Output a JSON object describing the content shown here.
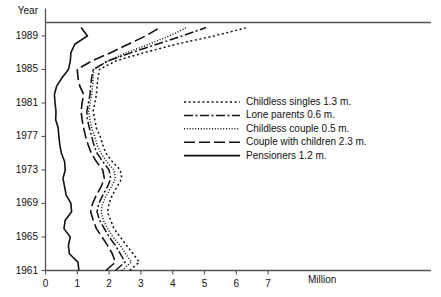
{
  "chart_data": {
    "type": "line",
    "title": "",
    "xlabel": "Million",
    "ylabel": "Year",
    "orientation": "horizontal-value-vertical-time",
    "xlim": [
      0,
      7.6
    ],
    "ylim": [
      1961,
      1990.6
    ],
    "grid": false,
    "xticks": [
      0,
      1,
      2,
      3,
      4,
      5,
      6,
      7
    ],
    "xticklabels": [
      "0",
      "1",
      "2",
      "3",
      "4",
      "5",
      "6",
      "7"
    ],
    "yticks": [
      1961,
      1965,
      1969,
      1973,
      1977,
      1981,
      1985,
      1989
    ],
    "yticklabels": [
      "1961",
      "1965",
      "1969",
      "1973",
      "1977",
      "1981",
      "1985",
      "1989"
    ],
    "legend_position": "center-right",
    "x": [
      1961,
      1962,
      1963,
      1964,
      1965,
      1966,
      1967,
      1968,
      1969,
      1970,
      1971,
      1972,
      1973,
      1974,
      1975,
      1976,
      1977,
      1978,
      1979,
      1980,
      1981,
      1982,
      1983,
      1984,
      1985,
      1986,
      1987,
      1988,
      1989,
      1990
    ],
    "series": [
      {
        "name": "Childless singles 1.3 m.",
        "label": "Childless singles",
        "value": 1.3,
        "dash": "2,2.6",
        "width": 1.5,
        "values": [
          2.65,
          2.95,
          2.75,
          2.55,
          2.35,
          2.15,
          2.05,
          1.95,
          2.0,
          2.1,
          2.25,
          2.4,
          2.35,
          2.1,
          1.9,
          1.8,
          1.72,
          1.6,
          1.55,
          1.5,
          1.55,
          1.6,
          1.62,
          1.65,
          1.7,
          2.2,
          3.1,
          4.1,
          5.3,
          6.35
        ]
      },
      {
        "name": "Lone parents 0.6 m.",
        "label": "Lone parents",
        "value": 0.6,
        "dash": "9,2.5,2,2.5",
        "width": 1.5,
        "values": [
          2.2,
          2.5,
          2.35,
          2.2,
          2.0,
          1.85,
          1.7,
          1.62,
          1.68,
          1.8,
          1.95,
          2.05,
          2.0,
          1.8,
          1.62,
          1.52,
          1.45,
          1.38,
          1.32,
          1.3,
          1.35,
          1.4,
          1.42,
          1.45,
          1.5,
          1.95,
          2.7,
          3.5,
          4.3,
          5.05
        ]
      },
      {
        "name": "Childless couple 0.5 m.",
        "label": "Childless couple",
        "value": 0.5,
        "dash": "1,1.8",
        "width": 1.5,
        "values": [
          2.4,
          2.7,
          2.52,
          2.35,
          2.12,
          1.95,
          1.82,
          1.75,
          1.8,
          1.92,
          2.08,
          2.2,
          2.15,
          1.92,
          1.74,
          1.62,
          1.55,
          1.45,
          1.4,
          1.36,
          1.4,
          1.45,
          1.48,
          1.5,
          1.52,
          1.95,
          2.55,
          3.25,
          3.9,
          4.45
        ]
      },
      {
        "name": "Couple with children 2.3 m.",
        "label": "Couple with children",
        "value": 2.3,
        "dash": "11,4",
        "width": 1.6,
        "values": [
          1.9,
          2.2,
          2.1,
          1.95,
          1.78,
          1.6,
          1.5,
          1.42,
          1.48,
          1.6,
          1.75,
          1.85,
          1.8,
          1.6,
          1.44,
          1.34,
          1.26,
          1.2,
          1.15,
          1.12,
          1.15,
          1.2,
          1.08,
          1.02,
          1.0,
          1.45,
          2.05,
          2.6,
          3.15,
          3.6
        ]
      },
      {
        "name": "Pensioners 1.2 m.",
        "label": "Pensioners",
        "value": 1.2,
        "dash": "",
        "width": 1.6,
        "values": [
          1.05,
          1.02,
          0.75,
          0.72,
          0.78,
          0.58,
          0.62,
          0.82,
          0.8,
          0.65,
          0.6,
          0.55,
          0.62,
          0.6,
          0.5,
          0.45,
          0.42,
          0.4,
          0.32,
          0.33,
          0.3,
          0.28,
          0.35,
          0.52,
          0.72,
          0.78,
          0.8,
          0.92,
          1.32,
          1.12
        ]
      }
    ]
  },
  "legend": {
    "items": [
      {
        "label": "Childless singles 1.3 m."
      },
      {
        "label": "Lone parents 0.6 m."
      },
      {
        "label": "Childless couple 0.5 m."
      },
      {
        "label": "Couple with children 2.3 m."
      },
      {
        "label": "Pensioners 1.2 m."
      }
    ]
  },
  "axes": {
    "year_label": "Year",
    "million_label": "Million"
  },
  "colors": {
    "line": "#111111",
    "axis": "#555555",
    "text": "#111111",
    "background": "#ffffff"
  }
}
